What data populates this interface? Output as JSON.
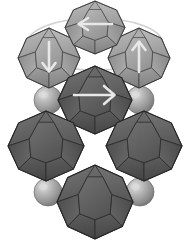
{
  "figure": {
    "title": "Polyhedral nanocrystal cluster with magnetization arrows",
    "background_color": "#ffffff",
    "width": 190,
    "height": 246
  },
  "palette": {
    "light_polyhedron_fill": "#9a9a9a",
    "light_polyhedron_face_a": "#a6a6a6",
    "light_polyhedron_face_b": "#8e8e8e",
    "light_polyhedron_face_c": "#b0b0b0",
    "dark_polyhedron_fill": "#5d5d5d",
    "dark_polyhedron_face_a": "#686868",
    "dark_polyhedron_face_b": "#525252",
    "dark_polyhedron_face_c": "#747474",
    "edge_line": "#3a3a3a",
    "edge_line_light": "#6e6e6e",
    "sphere_base": "#9e9e9e",
    "sphere_highlight": "#d8d8d8",
    "sphere_shadow": "#6f6f6f",
    "arrow_color": "#e8e8e8",
    "guide_ellipse_color": "#d2d2d2",
    "outline_color": "#ffffff"
  },
  "guides": [
    {
      "name": "orbit-ellipse",
      "shape": "ellipse",
      "cx": 95,
      "cy": 44,
      "rx": 68,
      "ry": 26,
      "stroke": "#d2d2d2",
      "stroke_width": 1.6
    }
  ],
  "polyhedra": [
    {
      "id": "top-center",
      "label": "Top center polyhedron",
      "tone": "light",
      "cx": 95,
      "cy": 27,
      "rx": 30,
      "ry": 27,
      "rotation": 0,
      "arrow": {
        "direction": "left",
        "label": "arrow-left"
      }
    },
    {
      "id": "upper-left",
      "label": "Upper left polyhedron",
      "tone": "light",
      "cx": 49,
      "cy": 58,
      "rx": 31,
      "ry": 30,
      "rotation": 0,
      "arrow": {
        "direction": "down",
        "label": "arrow-down"
      }
    },
    {
      "id": "upper-right",
      "label": "Upper right polyhedron",
      "tone": "light",
      "cx": 139,
      "cy": 58,
      "rx": 31,
      "ry": 30,
      "rotation": 0,
      "arrow": {
        "direction": "up",
        "label": "arrow-up"
      }
    },
    {
      "id": "center",
      "label": "Center polyhedron",
      "tone": "dark",
      "cx": 95,
      "cy": 100,
      "rx": 36,
      "ry": 33,
      "rotation": 0,
      "arrow": {
        "direction": "right",
        "label": "arrow-right"
      }
    },
    {
      "id": "middle-left",
      "label": "Middle left polyhedron",
      "tone": "dark",
      "cx": 46,
      "cy": 146,
      "rx": 37,
      "ry": 34,
      "rotation": 0,
      "arrow": null
    },
    {
      "id": "middle-right",
      "label": "Middle right polyhedron",
      "tone": "dark",
      "cx": 144,
      "cy": 146,
      "rx": 37,
      "ry": 34,
      "rotation": 0,
      "arrow": null
    },
    {
      "id": "bottom-center",
      "label": "Bottom center polyhedron",
      "tone": "dark",
      "cx": 95,
      "cy": 200,
      "rx": 37,
      "ry": 36,
      "rotation": 0,
      "arrow": null
    }
  ],
  "spheres": [
    {
      "id": "sphere-upper-left",
      "label": "Upper left sphere",
      "cx": 48,
      "cy": 100,
      "r": 14
    },
    {
      "id": "sphere-upper-right",
      "label": "Upper right sphere",
      "cx": 140,
      "cy": 100,
      "r": 14
    },
    {
      "id": "sphere-lower-left",
      "label": "Lower left sphere",
      "cx": 48,
      "cy": 192,
      "r": 14
    },
    {
      "id": "sphere-lower-right",
      "label": "Lower right sphere",
      "cx": 140,
      "cy": 192,
      "r": 14
    }
  ],
  "arrows": [
    {
      "id": "arrow-top-center",
      "direction": "left",
      "description": "Leftward magnetization arrow on top polyhedron"
    },
    {
      "id": "arrow-upper-left",
      "direction": "down",
      "description": "Downward magnetization arrow on upper left polyhedron"
    },
    {
      "id": "arrow-upper-right",
      "direction": "up",
      "description": "Upward magnetization arrow on upper right polyhedron"
    },
    {
      "id": "arrow-center",
      "direction": "right",
      "description": "Rightward magnetization arrow on center polyhedron"
    }
  ]
}
